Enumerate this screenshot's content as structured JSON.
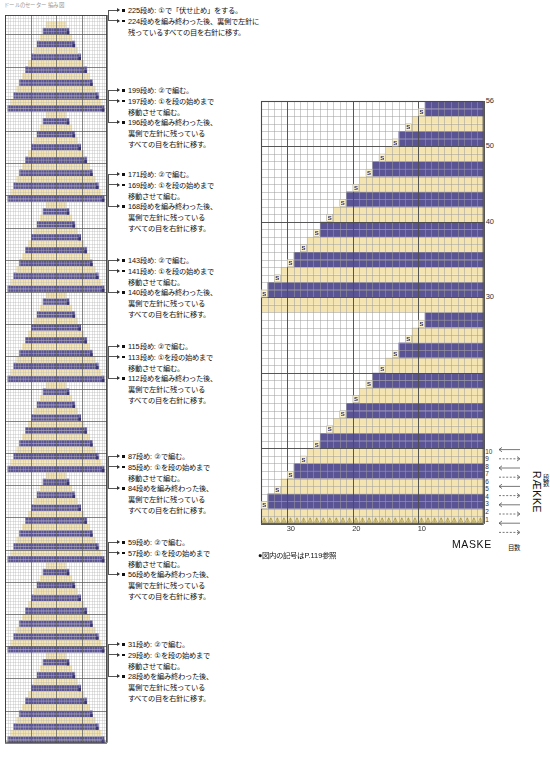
{
  "document": {
    "top_note": "ドールのセーター 編み図",
    "footnote": "●図内の記号はP.119参照"
  },
  "palette": {
    "purple": "#5b5494",
    "cream": "#f3e4b2",
    "grid_minor": "#9a9a9a",
    "grid_major": "#4a4a4a",
    "symbol_text": "#2b2b6e",
    "paper": "#ffffff"
  },
  "left_chart": {
    "name": "repeat-motif-chart",
    "columns": 40,
    "rows": 226,
    "motif_count": 8,
    "motif_rows": 28,
    "description": "縦に8回くり返す三角モチーフの編み図"
  },
  "annotations": [
    {
      "id": "ann-225",
      "lines": [
        "225段め: ①で「伏せ止め」をする。",
        "224段めを編み終わった後、裏側で左針に",
        "残っているすべての目を右針に移す。"
      ],
      "bullets": [
        0,
        1
      ]
    },
    {
      "id": "ann-199",
      "lines": [
        "199段め: ②で編む。",
        "197段め: ①を段の始めまで",
        "移動させて編む。",
        "196段めを編み終わった後、",
        "裏側で左針に残っている",
        "すべての目を右針に移す。"
      ],
      "bullets": [
        0,
        1,
        3
      ]
    },
    {
      "id": "ann-171",
      "lines": [
        "171段め: ②で編む。",
        "169段め: ①を段の始めまで",
        "移動させて編む。",
        "168段めを編み終わった後、",
        "裏側で左針に残っている",
        "すべての目を右針に移す。"
      ],
      "bullets": [
        0,
        1,
        3
      ]
    },
    {
      "id": "ann-143",
      "lines": [
        "143段め: ②で編む。",
        "141段め: ①を段の始めまで",
        "移動させて編む。",
        "140段めを編み終わった後、",
        "裏側で左針に残っている",
        "すべての目を右針に移す。"
      ],
      "bullets": [
        0,
        1,
        3
      ]
    },
    {
      "id": "ann-115",
      "lines": [
        "115段め: ②で編む。",
        "113段め: ①を段の始めまで",
        "移動させて編む。",
        "112段めを編み終わった後、",
        "裏側で左針に残っている",
        "すべての目を右針に移す。"
      ],
      "bullets": [
        0,
        1,
        3
      ]
    },
    {
      "id": "ann-87",
      "lines": [
        "87段め: ②で編む。",
        "85段め: ①を段の始めまで",
        "移動させて編む。",
        "84段めを編み終わった後、",
        "裏側で左針に残っている",
        "すべての目を右針に移す。"
      ],
      "bullets": [
        0,
        1,
        3
      ]
    },
    {
      "id": "ann-59",
      "lines": [
        "59段め: ②で編む。",
        "57段め: ①を段の始めまで",
        "移動させて編む。",
        "56段めを編み終わった後、",
        "裏側で左針に残っている",
        "すべての目を右針に移す。"
      ],
      "bullets": [
        0,
        1,
        3
      ]
    },
    {
      "id": "ann-31",
      "lines": [
        "31段め: ②で編む。",
        "29段め: ①を段の始めまで",
        "移動させて編む。",
        "28段めを編み終わった後、",
        "裏側で左針に残っている",
        "すべての目を右針に移す。"
      ],
      "bullets": [
        0,
        1,
        3
      ]
    }
  ],
  "chart_data": {
    "type": "heatmap",
    "title": "",
    "xlabel": "MASKE",
    "xlabel_sub": "目数",
    "ylabel": "RÆKKE",
    "ylabel_sub": "段数",
    "grid": true,
    "legend_position": "none",
    "columns": 34,
    "rows": 56,
    "xlim": [
      1,
      34
    ],
    "ylim": [
      1,
      56
    ],
    "x_ticks": [
      10,
      20,
      30
    ],
    "x_tick_labels": [
      "10",
      "20",
      "30"
    ],
    "x_tick_direction": "right-to-left",
    "y_ticks": [
      30,
      40,
      50,
      56
    ],
    "y_tick_labels": [
      "30",
      "40",
      "50",
      "56"
    ],
    "y_minor_ticks": [
      1,
      2,
      3,
      4,
      5,
      6,
      7,
      8,
      9,
      10
    ],
    "y_minor_tick_labels": [
      "1",
      "2",
      "3",
      "4",
      "5",
      "6",
      "7",
      "8",
      "9",
      "10"
    ],
    "colors": {
      "purple": "#5b5494",
      "cream": "#f3e4b2",
      "empty": "#ffffff"
    },
    "symbol": "S",
    "symbol_meaning": "すべり目",
    "note": "各段の右端（左方向の端）にS記号。奇数段=紺、偶数段=生成り。2つの三角形（下段28段・上段28段）で構成。",
    "rows_data": [
      {
        "row": 1,
        "color": "cream",
        "width": 34,
        "symbol": false
      },
      {
        "row": 2,
        "color": "cream",
        "width": 34,
        "symbol": false
      },
      {
        "row": 3,
        "color": "purple",
        "width": 33,
        "symbol": true
      },
      {
        "row": 4,
        "color": "purple",
        "width": 33,
        "symbol": false
      },
      {
        "row": 5,
        "color": "cream",
        "width": 31,
        "symbol": true
      },
      {
        "row": 6,
        "color": "cream",
        "width": 31,
        "symbol": false
      },
      {
        "row": 7,
        "color": "purple",
        "width": 29,
        "symbol": true
      },
      {
        "row": 8,
        "color": "purple",
        "width": 29,
        "symbol": false
      },
      {
        "row": 9,
        "color": "cream",
        "width": 27,
        "symbol": true
      },
      {
        "row": 10,
        "color": "cream",
        "width": 27,
        "symbol": false
      },
      {
        "row": 11,
        "color": "purple",
        "width": 25,
        "symbol": true
      },
      {
        "row": 12,
        "color": "purple",
        "width": 25,
        "symbol": false
      },
      {
        "row": 13,
        "color": "cream",
        "width": 23,
        "symbol": true
      },
      {
        "row": 14,
        "color": "cream",
        "width": 23,
        "symbol": false
      },
      {
        "row": 15,
        "color": "purple",
        "width": 21,
        "symbol": true
      },
      {
        "row": 16,
        "color": "purple",
        "width": 21,
        "symbol": false
      },
      {
        "row": 17,
        "color": "cream",
        "width": 19,
        "symbol": true
      },
      {
        "row": 18,
        "color": "cream",
        "width": 19,
        "symbol": false
      },
      {
        "row": 19,
        "color": "purple",
        "width": 17,
        "symbol": true
      },
      {
        "row": 20,
        "color": "purple",
        "width": 17,
        "symbol": false
      },
      {
        "row": 21,
        "color": "cream",
        "width": 15,
        "symbol": true
      },
      {
        "row": 22,
        "color": "cream",
        "width": 15,
        "symbol": false
      },
      {
        "row": 23,
        "color": "purple",
        "width": 13,
        "symbol": true
      },
      {
        "row": 24,
        "color": "purple",
        "width": 13,
        "symbol": false
      },
      {
        "row": 25,
        "color": "cream",
        "width": 11,
        "symbol": true
      },
      {
        "row": 26,
        "color": "cream",
        "width": 11,
        "symbol": false
      },
      {
        "row": 27,
        "color": "purple",
        "width": 9,
        "symbol": true
      },
      {
        "row": 28,
        "color": "purple",
        "width": 9,
        "symbol": false
      },
      {
        "row": 29,
        "color": "cream",
        "width": 34,
        "symbol": false
      },
      {
        "row": 30,
        "color": "cream",
        "width": 34,
        "symbol": false
      },
      {
        "row": 31,
        "color": "purple",
        "width": 33,
        "symbol": true
      },
      {
        "row": 32,
        "color": "purple",
        "width": 33,
        "symbol": false
      },
      {
        "row": 33,
        "color": "cream",
        "width": 31,
        "symbol": true
      },
      {
        "row": 34,
        "color": "cream",
        "width": 31,
        "symbol": false
      },
      {
        "row": 35,
        "color": "purple",
        "width": 29,
        "symbol": true
      },
      {
        "row": 36,
        "color": "purple",
        "width": 29,
        "symbol": false
      },
      {
        "row": 37,
        "color": "cream",
        "width": 27,
        "symbol": true
      },
      {
        "row": 38,
        "color": "cream",
        "width": 27,
        "symbol": false
      },
      {
        "row": 39,
        "color": "purple",
        "width": 25,
        "symbol": true
      },
      {
        "row": 40,
        "color": "purple",
        "width": 25,
        "symbol": false
      },
      {
        "row": 41,
        "color": "cream",
        "width": 23,
        "symbol": true
      },
      {
        "row": 42,
        "color": "cream",
        "width": 23,
        "symbol": false
      },
      {
        "row": 43,
        "color": "purple",
        "width": 21,
        "symbol": true
      },
      {
        "row": 44,
        "color": "purple",
        "width": 21,
        "symbol": false
      },
      {
        "row": 45,
        "color": "cream",
        "width": 19,
        "symbol": true
      },
      {
        "row": 46,
        "color": "cream",
        "width": 19,
        "symbol": false
      },
      {
        "row": 47,
        "color": "purple",
        "width": 17,
        "symbol": true
      },
      {
        "row": 48,
        "color": "purple",
        "width": 17,
        "symbol": false
      },
      {
        "row": 49,
        "color": "cream",
        "width": 15,
        "symbol": true
      },
      {
        "row": 50,
        "color": "cream",
        "width": 15,
        "symbol": false
      },
      {
        "row": 51,
        "color": "purple",
        "width": 13,
        "symbol": true
      },
      {
        "row": 52,
        "color": "purple",
        "width": 13,
        "symbol": false
      },
      {
        "row": 53,
        "color": "cream",
        "width": 11,
        "symbol": true
      },
      {
        "row": 54,
        "color": "cream",
        "width": 11,
        "symbol": false
      },
      {
        "row": 55,
        "color": "purple",
        "width": 9,
        "symbol": true
      },
      {
        "row": 56,
        "color": "purple",
        "width": 9,
        "symbol": false
      }
    ]
  }
}
